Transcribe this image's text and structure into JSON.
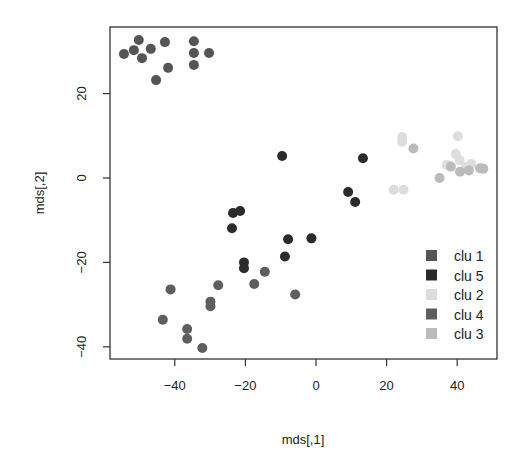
{
  "chart_data": {
    "type": "scatter",
    "title": "",
    "xlabel": "mds[,1]",
    "ylabel": "mds[,2]",
    "xlim": [
      -57,
      51
    ],
    "ylim": [
      -43,
      35
    ],
    "xticks": [
      -40,
      -20,
      0,
      20,
      40
    ],
    "yticks": [
      -40,
      -20,
      0,
      20
    ],
    "grid": false,
    "legend_position": "bottom-right",
    "series": [
      {
        "name": "clu 1",
        "color": "#555555",
        "points": [
          [
            -54.4,
            29.4
          ],
          [
            -51.6,
            30.3
          ],
          [
            -50.2,
            32.7
          ],
          [
            -49.3,
            28.4
          ],
          [
            -46.8,
            30.6
          ],
          [
            -45.3,
            23.2
          ],
          [
            -42.8,
            32.2
          ],
          [
            -41.9,
            26.1
          ],
          [
            -34.6,
            32.4
          ],
          [
            -34.6,
            29.6
          ],
          [
            -34.6,
            26.8
          ],
          [
            -30.3,
            29.6
          ]
        ]
      },
      {
        "name": "clu 5",
        "color": "#2b2b2b",
        "points": [
          [
            -9.6,
            5.2
          ],
          [
            13.3,
            4.7
          ],
          [
            9.1,
            -3.3
          ],
          [
            11.1,
            -5.7
          ],
          [
            -23.5,
            -8.3
          ],
          [
            -23.8,
            -11.9
          ],
          [
            -20.4,
            -20.0
          ],
          [
            -20.4,
            -21.4
          ],
          [
            -7.9,
            -14.5
          ],
          [
            -1.3,
            -14.3
          ],
          [
            -8.8,
            -18.6
          ],
          [
            -21.5,
            -7.8
          ]
        ]
      },
      {
        "name": "clu 2",
        "color": "#dddddd",
        "points": [
          [
            24.4,
            9.7
          ],
          [
            24.4,
            8.6
          ],
          [
            40.2,
            9.9
          ],
          [
            22.0,
            -2.8
          ],
          [
            24.8,
            -2.8
          ],
          [
            37.0,
            3.1
          ],
          [
            39.6,
            5.7
          ],
          [
            40.7,
            4.2
          ],
          [
            42.5,
            2.6
          ],
          [
            44.0,
            3.3
          ]
        ]
      },
      {
        "name": "clu 4",
        "color": "#5e5e5e",
        "points": [
          [
            -41.2,
            -26.4
          ],
          [
            -43.4,
            -33.6
          ],
          [
            -36.5,
            -35.8
          ],
          [
            -36.5,
            -38.1
          ],
          [
            -32.2,
            -40.3
          ],
          [
            -29.9,
            -29.3
          ],
          [
            -29.9,
            -30.4
          ],
          [
            -27.7,
            -25.4
          ],
          [
            -17.5,
            -25.1
          ],
          [
            -14.5,
            -22.2
          ],
          [
            -5.9,
            -27.6
          ]
        ]
      },
      {
        "name": "clu 3",
        "color": "#bbbbbb",
        "points": [
          [
            27.6,
            7.0
          ],
          [
            35.0,
            0.0
          ],
          [
            40.8,
            1.5
          ],
          [
            43.3,
            1.8
          ],
          [
            46.5,
            2.3
          ],
          [
            47.4,
            2.2
          ],
          [
            38.2,
            2.7
          ]
        ]
      }
    ]
  }
}
